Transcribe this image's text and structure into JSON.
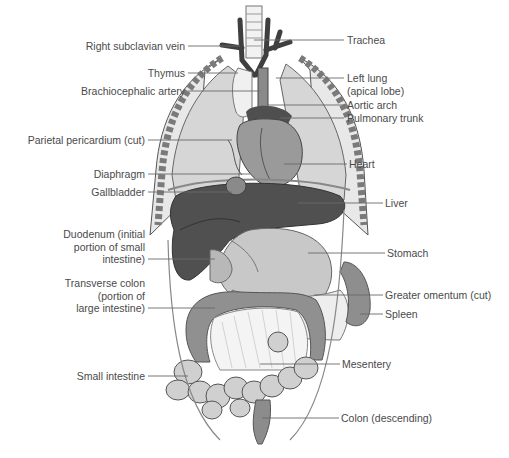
{
  "figure": {
    "type": "anatomical-diagram",
    "colors": {
      "background": "#ffffff",
      "label_text": "#4a4a4a",
      "leader_line": "#6a6a6a",
      "dark_organ": "#555555",
      "mid_organ": "#8c8c8c",
      "light_organ": "#cfcfcf",
      "pale_organ": "#e4e4e4"
    }
  },
  "labels": {
    "left": [
      {
        "id": "right-subclavian-vein",
        "lines": [
          "Right subclavian vein"
        ]
      },
      {
        "id": "thymus",
        "lines": [
          "Thymus"
        ]
      },
      {
        "id": "brachiocephalic-artery",
        "lines": [
          "Brachiocephalic artery"
        ]
      },
      {
        "id": "parietal-pericardium",
        "lines": [
          "Parietal pericardium (cut)"
        ]
      },
      {
        "id": "diaphragm",
        "lines": [
          "Diaphragm"
        ]
      },
      {
        "id": "gallbladder",
        "lines": [
          "Gallbladder"
        ]
      },
      {
        "id": "duodenum",
        "lines": [
          "Duodenum (initial",
          "portion of small",
          "intestine)"
        ]
      },
      {
        "id": "transverse-colon",
        "lines": [
          "Transverse colon",
          "(portion of",
          "large intestine)"
        ]
      },
      {
        "id": "small-intestine",
        "lines": [
          "Small intestine"
        ]
      }
    ],
    "right": [
      {
        "id": "trachea",
        "lines": [
          "Trachea"
        ]
      },
      {
        "id": "left-lung",
        "lines": [
          "Left lung",
          "(apical lobe)"
        ]
      },
      {
        "id": "aortic-arch",
        "lines": [
          "Aortic arch"
        ]
      },
      {
        "id": "pulmonary-trunk",
        "lines": [
          "Pulmonary trunk"
        ]
      },
      {
        "id": "heart",
        "lines": [
          "Heart"
        ]
      },
      {
        "id": "liver",
        "lines": [
          "Liver"
        ]
      },
      {
        "id": "stomach",
        "lines": [
          "Stomach"
        ]
      },
      {
        "id": "greater-omentum",
        "lines": [
          "Greater omentum (cut)"
        ]
      },
      {
        "id": "spleen",
        "lines": [
          "Spleen"
        ]
      },
      {
        "id": "mesentery",
        "lines": [
          "Mesentery"
        ]
      },
      {
        "id": "colon-descending",
        "lines": [
          "Colon (descending)"
        ]
      }
    ]
  }
}
